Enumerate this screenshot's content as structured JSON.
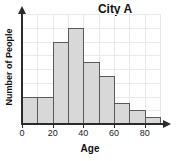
{
  "chart_data": {
    "type": "bar",
    "title": "City A",
    "xlabel": "Age",
    "ylabel": "Number of People",
    "categories": [
      "0-10",
      "10-20",
      "20-30",
      "30-40",
      "40-50",
      "50-60",
      "60-70",
      "70-80",
      "80-90"
    ],
    "bin_edges": [
      0,
      10,
      20,
      30,
      40,
      50,
      60,
      70,
      80,
      90
    ],
    "values": [
      2,
      2,
      6,
      7,
      4.5,
      3.5,
      1.5,
      1,
      0.5
    ],
    "xlim": [
      0,
      90
    ],
    "ylim": [
      0,
      8
    ],
    "xticks": [
      0,
      20,
      40,
      60,
      80
    ],
    "xtick_labels": [
      "0",
      "20",
      "40",
      "60",
      "80"
    ],
    "yticks": [
      0,
      1,
      2,
      3,
      4,
      5,
      6,
      7,
      8
    ],
    "ytick_labels": [
      "",
      "",
      "",
      "",
      "",
      "",
      "",
      "",
      ""
    ],
    "grid": true,
    "grid_axis": "both",
    "legend": false,
    "bar_color": "#d8d8d8",
    "bar_edge_color": "#5a5a5a",
    "grid_color": "#e9e9e9",
    "axis_color": "#2b2b2b"
  }
}
